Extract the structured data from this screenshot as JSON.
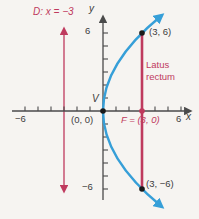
{
  "colors": {
    "accent_red": "#bf3a5e",
    "curve_blue": "#369fd8",
    "axis_dark": "#4a4a4a",
    "background": "#f6f4f1",
    "point_black": "#1a1a1a"
  },
  "labels": {
    "directrix": "D: x = −3",
    "y_axis": "y",
    "x_axis": "x",
    "y_tick_top": "6",
    "y_tick_bottom": "−6",
    "x_tick_left": "−6",
    "x_tick_right": "6",
    "vertex": "V",
    "origin": "(0, 0)",
    "focus": "F = (3, 0)",
    "latus_rectum": "Latus rectum",
    "point_upper": "(3, 6)",
    "point_lower": "(3, −6)"
  },
  "figure": {
    "type": "parabola-graph",
    "directrix_equation": "x = −3",
    "vertex_point": [
      0,
      0
    ],
    "focus_point": [
      3,
      0
    ],
    "latus_rectum_endpoints": [
      [
        3,
        6
      ],
      [
        3,
        -6
      ]
    ],
    "x_axis_shown_tick_value": 6,
    "y_axis_shown_tick_value": 6
  }
}
